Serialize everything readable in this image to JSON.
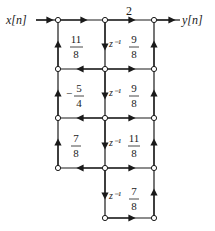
{
  "diagram": {
    "type": "signal-flow-graph",
    "input_label": "x[n]",
    "output_label": "y[n]",
    "colors": {
      "line": "#1a1a1a",
      "node_fill": "#ffffff",
      "background": "#ffffff"
    },
    "nodes": {
      "columns_x": [
        58,
        105,
        154
      ],
      "rows_y": [
        20,
        69,
        118,
        168,
        218
      ]
    },
    "gains": {
      "top_direct": "2",
      "row1_left": {
        "num": "11",
        "den": "8"
      },
      "row1_right": {
        "num": "9",
        "den": "8"
      },
      "row2_left": {
        "sign": "−",
        "num": "5",
        "den": "4"
      },
      "row2_right": {
        "num": "9",
        "den": "8"
      },
      "row3_left": {
        "num": "7",
        "den": "8"
      },
      "row3_right": {
        "num": "11",
        "den": "8"
      },
      "row4_right": {
        "num": "7",
        "den": "8"
      }
    },
    "delays": [
      "z⁻¹",
      "z⁻¹",
      "z⁻¹",
      "z⁻¹"
    ]
  }
}
